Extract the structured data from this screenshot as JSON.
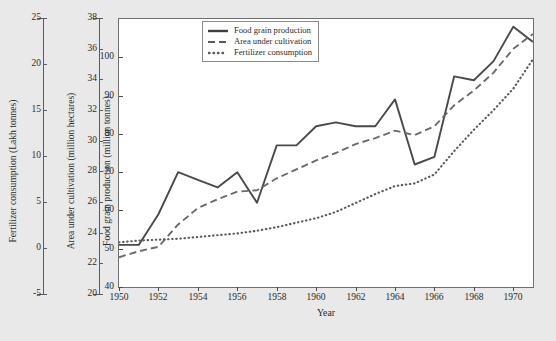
{
  "figure": {
    "background_color": "#e9e9e9",
    "plot_background_color": "#ffffff",
    "line_color": "#4a4a4a",
    "axis_color": "#5b5b5b"
  },
  "axes": {
    "fertilizer": {
      "title": "Fertilizer consumption (Lakh tonnes)",
      "ticks": [
        25,
        20,
        15,
        10,
        5,
        0,
        -5
      ],
      "tick_labels": [
        "25",
        "20",
        "15",
        "10",
        "5",
        "0",
        "-5"
      ],
      "min": -5,
      "max": 25
    },
    "area": {
      "title": "Area under cultivation (million hectares)",
      "ticks": [
        38,
        36,
        34,
        32,
        30,
        28,
        26,
        24,
        22,
        20
      ],
      "tick_labels": [
        "38",
        "36",
        "34",
        "32",
        "30",
        "28",
        "26",
        "24",
        "22",
        "20"
      ],
      "min": 20,
      "max": 38
    },
    "production": {
      "title": "Food grain production (million tonnes)",
      "ticks": [
        100,
        90,
        80,
        70,
        60,
        50,
        40
      ],
      "tick_labels": [
        "100",
        "90",
        "80",
        "70",
        "60",
        "50",
        "40"
      ],
      "min": 40,
      "max": 110
    },
    "x": {
      "title": "Year",
      "ticks": [
        1950,
        1952,
        1954,
        1956,
        1958,
        1960,
        1962,
        1964,
        1966,
        1968,
        1970
      ],
      "tick_labels": [
        "1950",
        "1952",
        "1954",
        "1956",
        "1958",
        "1960",
        "1962",
        "1964",
        "1966",
        "1968",
        "1970"
      ],
      "min": 1950,
      "max": 1971
    }
  },
  "legend": {
    "position": "top-center",
    "entries": [
      {
        "label": "Food grain production",
        "style": "solid",
        "icon": "solid-line-swatch"
      },
      {
        "label": "Area under cultivation",
        "style": "dashed",
        "icon": "dashed-line-swatch"
      },
      {
        "label": "Fertilizer consumption",
        "style": "dotted",
        "icon": "dotted-line-swatch"
      }
    ]
  },
  "chart_data": {
    "type": "line",
    "title": "",
    "subtitle": "",
    "xlabel": "Year",
    "ylabel": "Food grain production (million tonnes)",
    "grid": false,
    "legend_position": "top-center",
    "x": [
      1950,
      1951,
      1952,
      1953,
      1954,
      1955,
      1956,
      1957,
      1958,
      1959,
      1960,
      1961,
      1962,
      1963,
      1964,
      1965,
      1966,
      1967,
      1968,
      1969,
      1970,
      1971
    ],
    "xlim": [
      1950,
      1971
    ],
    "ylim": [
      40,
      110
    ],
    "series": [
      {
        "name": "Food grain production",
        "unit": "million tonnes",
        "axis": "production",
        "style": "solid",
        "ylim": [
          40,
          110
        ],
        "values": [
          51,
          51,
          59,
          70,
          68,
          66,
          70,
          62,
          77,
          77,
          82,
          83,
          82,
          82,
          89,
          72,
          74,
          95,
          94,
          99,
          108,
          104
        ]
      },
      {
        "name": "Area under cultivation",
        "unit": "million hectares",
        "axis": "area",
        "style": "dashed",
        "ylim": [
          20,
          38
        ],
        "values": [
          22.0,
          22.4,
          22.7,
          24.2,
          25.3,
          25.9,
          26.4,
          26.5,
          27.3,
          27.9,
          28.5,
          29.0,
          29.6,
          30.0,
          30.5,
          30.2,
          30.8,
          32.2,
          33.2,
          34.4,
          36.0,
          37.0
        ]
      },
      {
        "name": "Fertilizer consumption",
        "unit": "Lakh tonnes",
        "axis": "fertilizer",
        "style": "dotted",
        "ylim": [
          -5,
          25
        ],
        "values": [
          0.0,
          0.2,
          0.3,
          0.4,
          0.6,
          0.8,
          1.0,
          1.3,
          1.7,
          2.2,
          2.7,
          3.4,
          4.4,
          5.4,
          6.3,
          6.6,
          7.6,
          10.2,
          12.6,
          14.8,
          17.2,
          20.5
        ]
      }
    ]
  }
}
